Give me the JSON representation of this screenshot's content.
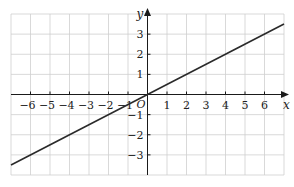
{
  "chart_data": {
    "type": "line",
    "title": "",
    "xlabel": "x",
    "ylabel": "y",
    "origin_label": "O",
    "xlim": [
      -7,
      7
    ],
    "ylim": [
      -4,
      4
    ],
    "grid": true,
    "x_ticks": [
      -6,
      -5,
      -4,
      -3,
      -2,
      -1,
      1,
      2,
      3,
      4,
      5,
      6
    ],
    "y_ticks": [
      -3,
      -2,
      -1,
      1,
      2,
      3
    ],
    "x_tick_labels": [
      "−6",
      "−5",
      "−4",
      "−3",
      "−2",
      "−1",
      "1",
      "2",
      "3",
      "4",
      "5",
      "6"
    ],
    "y_tick_labels": [
      "−3",
      "−2",
      "−1",
      "1",
      "2",
      "3"
    ],
    "series": [
      {
        "name": "y = 0.5x",
        "equation": "y = x/2",
        "x": [
          -7,
          7
        ],
        "y": [
          -3.5,
          3.5
        ],
        "color": "#2a2a2a"
      }
    ]
  }
}
